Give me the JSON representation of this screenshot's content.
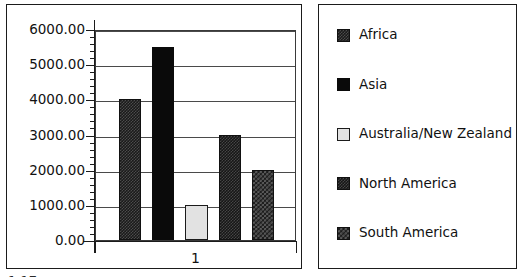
{
  "chart_data": {
    "type": "bar",
    "title": "",
    "subtitle": "",
    "xlabel": "",
    "ylabel": "",
    "categories": [
      "1"
    ],
    "series": [
      {
        "name": "Africa",
        "values": [
          4000
        ],
        "swatch": "checker-fine",
        "color": "#1a1a1a"
      },
      {
        "name": "Asia",
        "values": [
          5500
        ],
        "swatch": "solid-black",
        "color": "#0a0a0a"
      },
      {
        "name": "Australia/New Zealand",
        "values": [
          1000
        ],
        "swatch": "light-gray",
        "color": "#e2e2e2"
      },
      {
        "name": "North America",
        "values": [
          3000
        ],
        "swatch": "checker-dark",
        "color": "#161616"
      },
      {
        "name": "South America",
        "values": [
          2000
        ],
        "swatch": "checker-coarse",
        "color": "#1d1d1d"
      }
    ],
    "ylim": [
      0,
      6000
    ],
    "ytick_labels": [
      "6000.00",
      "5000.00",
      "4000.00",
      "3000.00",
      "2000.00",
      "1000.00",
      "0.00"
    ],
    "ytick_values": [
      6000,
      5000,
      4000,
      3000,
      2000,
      1000,
      0
    ],
    "ytick_minor_step": 200,
    "xtick_labels": [
      "1"
    ],
    "grid": true,
    "grid_axis": "y",
    "legend_position": "right",
    "legend_entries": [
      "Africa",
      "Asia",
      "Australia/New Zealand",
      "North America",
      "South America"
    ]
  },
  "axis": {
    "y_labels": [
      "6000.00",
      "5000.00",
      "4000.00",
      "3000.00",
      "2000.00",
      "1000.00",
      "0.00"
    ],
    "x_labels": [
      "1"
    ]
  },
  "legend": {
    "items": [
      {
        "label": "Africa"
      },
      {
        "label": "Asia"
      },
      {
        "label": "Australia/New Zealand"
      },
      {
        "label": "North America"
      },
      {
        "label": "South America"
      }
    ]
  },
  "artifact": {
    "clipped_text": "1.17"
  }
}
